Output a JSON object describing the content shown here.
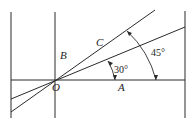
{
  "diagram": {
    "labels": {
      "O": "O",
      "A": "A",
      "B": "B",
      "C": "C"
    },
    "angles": {
      "small": "30°",
      "large": "45°"
    },
    "colors": {
      "line": "#2a2a2a",
      "background": "#ffffff"
    }
  }
}
